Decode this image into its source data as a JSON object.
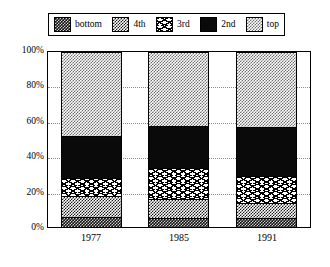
{
  "legend": {
    "position": "top",
    "items": [
      {
        "label": "bottom",
        "pattern": "solid-black"
      },
      {
        "label": "4th",
        "pattern": "checker-dark"
      },
      {
        "label": "3rd",
        "pattern": "zigzag"
      },
      {
        "label": "2nd",
        "pattern": "solid-black"
      },
      {
        "label": "top",
        "pattern": "checker-light"
      }
    ]
  },
  "axes": {
    "y_ticks": [
      "0%",
      "20%",
      "40%",
      "60%",
      "80%",
      "100%"
    ],
    "x_ticks": [
      "1977",
      "1985",
      "1991"
    ]
  },
  "chart_data": {
    "type": "bar",
    "stacked": true,
    "title": "",
    "xlabel": "",
    "ylabel": "",
    "ylim": [
      0,
      100
    ],
    "grid": true,
    "legend_position": "top",
    "categories": [
      "1977",
      "1985",
      "1991"
    ],
    "series": [
      {
        "name": "bottom",
        "pattern": "checker-darkest",
        "values": [
          6,
          5,
          5
        ]
      },
      {
        "name": "4th",
        "pattern": "checker-dark",
        "values": [
          12,
          11,
          9
        ]
      },
      {
        "name": "3rd",
        "pattern": "zigzag",
        "values": [
          10,
          18,
          15
        ]
      },
      {
        "name": "2nd",
        "pattern": "solid-black",
        "values": [
          24,
          24,
          28
        ]
      },
      {
        "name": "top",
        "pattern": "checker-light",
        "values": [
          48,
          42,
          43
        ]
      }
    ],
    "cumulative_boundaries": {
      "1977": [
        0,
        6,
        18,
        28,
        52,
        100
      ],
      "1985": [
        0,
        5,
        16,
        34,
        58,
        100
      ],
      "1991": [
        0,
        5,
        14,
        29,
        57,
        100
      ]
    }
  },
  "colors": {
    "ink": "#000000",
    "background": "#ffffff",
    "gridline": "#8a8a8a"
  }
}
